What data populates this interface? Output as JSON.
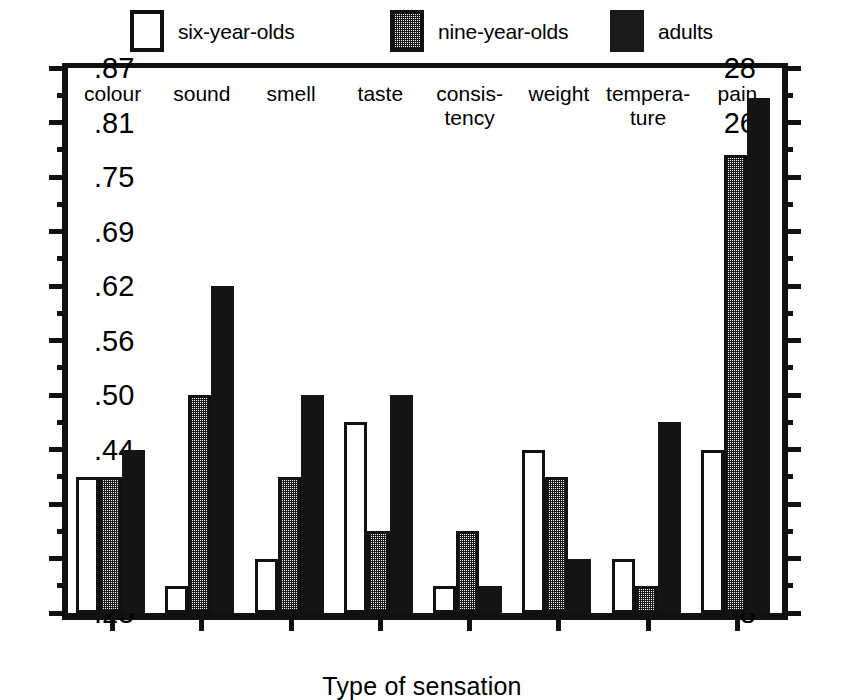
{
  "chart_data": {
    "type": "bar",
    "title": "",
    "xlabel": "Type of sensation",
    "ylabel": "",
    "ylim": [
      8,
      28
    ],
    "grid": false,
    "legend_position": "top",
    "categories": [
      "colour",
      "sound",
      "smell",
      "taste",
      "consis-\ntency",
      "weight",
      "tempera-\nture",
      "pain"
    ],
    "series": [
      {
        "name": "six-year-olds",
        "swatch": "white",
        "values": [
          13,
          9,
          10,
          15,
          9,
          14,
          10,
          14
        ]
      },
      {
        "name": "nine-year-olds",
        "swatch": "gray",
        "values": [
          13,
          16,
          13,
          11,
          11,
          13,
          9,
          24.8
        ]
      },
      {
        "name": "adults",
        "swatch": "black",
        "values": [
          14,
          20,
          16,
          16,
          9,
          10,
          15,
          26.9
        ]
      }
    ],
    "left_axis": {
      "label": "",
      "major_ticks": [
        8,
        10,
        12,
        14,
        16,
        18,
        20,
        22,
        24,
        26,
        28
      ],
      "major_tick_labels": [
        "8",
        "10",
        "12",
        "14",
        "16",
        "18",
        "20",
        "22",
        "24",
        "26",
        "28"
      ],
      "minor_ticks": [
        9,
        11,
        13,
        15,
        17,
        19,
        21,
        23,
        25,
        27
      ]
    },
    "right_axis": {
      "label": "",
      "major_ticks": [
        8,
        10,
        12,
        14,
        16,
        18,
        20,
        22,
        24,
        26,
        28
      ],
      "major_tick_labels": [
        ".25",
        ".31",
        ".37",
        ".44",
        ".50",
        ".56",
        ".62",
        ".69",
        ".75",
        ".81",
        ".87"
      ],
      "minor_ticks": [
        9,
        11,
        13,
        15,
        17,
        19,
        21,
        23,
        25,
        27
      ]
    },
    "colors": {
      "axis": "#111111",
      "six_year_olds": "#ffffff",
      "nine_year_olds": "#9a9a9a",
      "adults": "#141414",
      "background": "#ffffff"
    }
  }
}
